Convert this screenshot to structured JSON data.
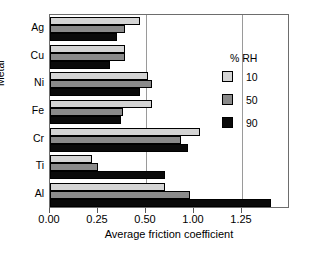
{
  "chart_data": {
    "type": "bar",
    "orientation": "horizontal",
    "title": "",
    "xlabel": "Average friction coefficient",
    "ylabel": "Metal",
    "categories": [
      "Ag",
      "Cu",
      "Ni",
      "Fe",
      "Cr",
      "Ti",
      "Al"
    ],
    "series": [
      {
        "name": "10",
        "values": [
          0.47,
          0.39,
          0.51,
          0.53,
          0.78,
          0.22,
          0.6
        ]
      },
      {
        "name": "50",
        "values": [
          0.39,
          0.39,
          0.53,
          0.38,
          0.68,
          0.25,
          0.73
        ]
      },
      {
        "name": "90",
        "values": [
          0.35,
          0.31,
          0.47,
          0.37,
          0.72,
          0.6,
          1.15
        ]
      }
    ],
    "legend_title": "% RH",
    "legend_position": "right-inside",
    "xlim": [
      0.0,
      1.25
    ],
    "xticks": [
      0.0,
      0.25,
      0.5,
      0.75,
      1.0
    ],
    "xticklabels": [
      "0.00",
      "0.25",
      "0.50",
      "1.00",
      "1.25"
    ],
    "gridlines_x": [
      0.5,
      1.0
    ],
    "grid": true,
    "series_colors": [
      "#d4d4d4",
      "#8a8a8a",
      "#0a0a0a"
    ]
  },
  "legend": {
    "title": "% RH",
    "entries": [
      {
        "label": "10",
        "swatch": "s10"
      },
      {
        "label": "50",
        "swatch": "s50"
      },
      {
        "label": "90",
        "swatch": "s90"
      }
    ]
  },
  "axes": {
    "x_title": "Average friction coefficient",
    "y_title": "Metal",
    "x_tick_labels": [
      "0.00",
      "0.25",
      "0.50",
      "1.00",
      "1.25"
    ],
    "y_tick_labels": [
      "Ag",
      "Cu",
      "Ni",
      "Fe",
      "Cr",
      "Ti",
      "Al"
    ]
  }
}
